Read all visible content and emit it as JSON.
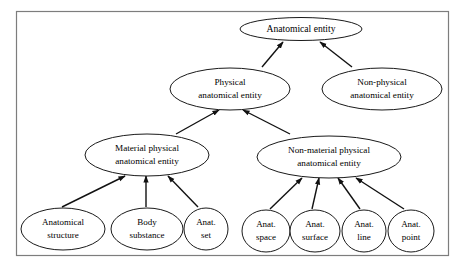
{
  "figure": {
    "kind": "taxonomy-diagram",
    "border_color": "#7d7d7d",
    "node_stroke_color": "#1a1a1a",
    "edge_color": "#111111",
    "background_color": "#ffffff",
    "relation": "is-a"
  },
  "nodes": {
    "root": {
      "line1": "Anatomical entity",
      "line2": ""
    },
    "physical": {
      "line1": "Physical",
      "line2": "anatomical entity"
    },
    "nonphysical": {
      "line1": "Non-physical",
      "line2": "anatomical entity"
    },
    "material": {
      "line1": "Material physical",
      "line2": "anatomical entity"
    },
    "nonmaterial": {
      "line1": "Non-material physical",
      "line2": "anatomical entity"
    },
    "structure": {
      "line1": "Anatomical",
      "line2": "structure"
    },
    "substance": {
      "line1": "Body",
      "line2": "substance"
    },
    "set": {
      "line1": "Anat.",
      "line2": "set"
    },
    "space": {
      "line1": "Anat.",
      "line2": "space"
    },
    "surface": {
      "line1": "Anat.",
      "line2": "surface"
    },
    "line": {
      "line1": "Anat.",
      "line2": "line"
    },
    "point": {
      "line1": "Anat.",
      "line2": "point"
    }
  }
}
